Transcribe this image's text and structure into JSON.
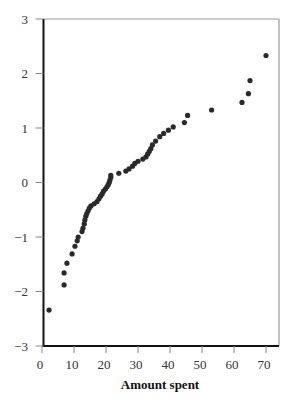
{
  "chart_data": {
    "type": "scatter",
    "title": "",
    "xlabel": "Amount spent",
    "ylabel": "",
    "xlim": [
      0,
      72.5
    ],
    "ylim": [
      -3,
      3
    ],
    "x_ticks": [
      0,
      10,
      20,
      30,
      40,
      50,
      60,
      70
    ],
    "y_ticks": [
      3,
      2,
      1,
      0,
      -1,
      -2,
      -3
    ],
    "grid": false,
    "legend": null,
    "series": [
      {
        "name": "Normal scores",
        "points": [
          [
            2.2,
            -2.34
          ],
          [
            6.9,
            -1.88
          ],
          [
            6.9,
            -1.66
          ],
          [
            7.8,
            -1.48
          ],
          [
            9.4,
            -1.31
          ],
          [
            10.3,
            -1.17
          ],
          [
            11.0,
            -1.07
          ],
          [
            11.3,
            -1.0
          ],
          [
            12.5,
            -0.9
          ],
          [
            12.8,
            -0.84
          ],
          [
            13.2,
            -0.76
          ],
          [
            13.4,
            -0.69
          ],
          [
            13.7,
            -0.62
          ],
          [
            14.0,
            -0.57
          ],
          [
            14.4,
            -0.52
          ],
          [
            14.8,
            -0.47
          ],
          [
            15.3,
            -0.43
          ],
          [
            16.3,
            -0.39
          ],
          [
            17.2,
            -0.35
          ],
          [
            17.8,
            -0.3
          ],
          [
            18.3,
            -0.25
          ],
          [
            18.8,
            -0.21
          ],
          [
            19.2,
            -0.16
          ],
          [
            19.8,
            -0.12
          ],
          [
            20.3,
            -0.08
          ],
          [
            20.7,
            -0.04
          ],
          [
            21.0,
            0.0
          ],
          [
            21.2,
            0.04
          ],
          [
            21.5,
            0.09
          ],
          [
            21.5,
            0.13
          ],
          [
            24.0,
            0.17
          ],
          [
            26.2,
            0.21
          ],
          [
            27.2,
            0.25
          ],
          [
            28.3,
            0.3
          ],
          [
            29.0,
            0.35
          ],
          [
            30.0,
            0.39
          ],
          [
            31.5,
            0.43
          ],
          [
            32.5,
            0.47
          ],
          [
            33.0,
            0.52
          ],
          [
            33.5,
            0.57
          ],
          [
            34.0,
            0.62
          ],
          [
            34.5,
            0.69
          ],
          [
            35.5,
            0.76
          ],
          [
            36.8,
            0.84
          ],
          [
            38.0,
            0.9
          ],
          [
            39.5,
            0.96
          ],
          [
            41.0,
            1.02
          ],
          [
            44.5,
            1.1
          ],
          [
            45.5,
            1.23
          ],
          [
            53.0,
            1.33
          ],
          [
            62.5,
            1.47
          ],
          [
            64.5,
            1.63
          ],
          [
            65.0,
            1.87
          ],
          [
            70.0,
            2.33
          ]
        ]
      }
    ]
  },
  "colors": {
    "points": "#2a2a2a",
    "axis": "#111111",
    "frame": "#9a9a9a",
    "tick": "#888888"
  }
}
